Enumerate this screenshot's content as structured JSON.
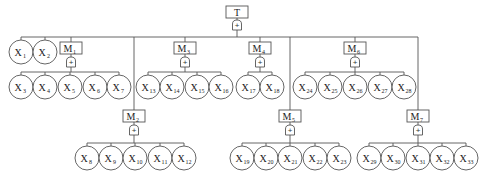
{
  "diagram": {
    "type": "fault-tree",
    "top_event": {
      "label": "T",
      "x": 237,
      "y": 6,
      "gate": "OR"
    },
    "bus_y": 37,
    "gate_symbol": "+",
    "intermediate_events": [
      {
        "id": "M1",
        "label": "M",
        "sub": "1",
        "x": 71,
        "y": 42,
        "children": [
          "X3",
          "X4",
          "X5",
          "X6",
          "X7"
        ],
        "child_y": 87,
        "child_xs": [
          21,
          45,
          70,
          95,
          119
        ]
      },
      {
        "id": "M2",
        "label": "M",
        "sub": "2",
        "x": 134,
        "y": 110,
        "children": [
          "X8",
          "X9",
          "X10",
          "X11",
          "X12"
        ],
        "child_y": 158,
        "child_xs": [
          87,
          111,
          135,
          160,
          184
        ]
      },
      {
        "id": "M3",
        "label": "M",
        "sub": "3",
        "x": 185,
        "y": 42,
        "children": [
          "X13",
          "X14",
          "X15",
          "X16"
        ],
        "child_y": 87,
        "child_xs": [
          148,
          172,
          197,
          221
        ]
      },
      {
        "id": "M4",
        "label": "M",
        "sub": "4",
        "x": 260,
        "y": 42,
        "children": [
          "X17",
          "X18"
        ],
        "child_y": 87,
        "child_xs": [
          248,
          272
        ]
      },
      {
        "id": "M5",
        "label": "M",
        "sub": "5",
        "x": 290,
        "y": 110,
        "children": [
          "X19",
          "X20",
          "X21",
          "X22",
          "X23"
        ],
        "child_y": 158,
        "child_xs": [
          242,
          266,
          290,
          315,
          339
        ]
      },
      {
        "id": "M6",
        "label": "M",
        "sub": "6",
        "x": 355,
        "y": 42,
        "children": [
          "X24",
          "X25",
          "X26",
          "X27",
          "X28"
        ],
        "child_y": 87,
        "child_xs": [
          305,
          330,
          355,
          380,
          404
        ]
      },
      {
        "id": "M7",
        "label": "M",
        "sub": "7",
        "x": 418,
        "y": 110,
        "children": [
          "X29",
          "X30",
          "X31",
          "X32",
          "X33"
        ],
        "child_y": 158,
        "child_xs": [
          369,
          393,
          418,
          442,
          466
        ]
      }
    ],
    "top_children_order": [
      "X1",
      "X2",
      "M1",
      "M2",
      "M3",
      "M4",
      "M5",
      "M6",
      "M7"
    ],
    "basic_events_top": [
      {
        "id": "X1",
        "label": "X",
        "sub": "1",
        "x": 21,
        "y": 52
      },
      {
        "id": "X2",
        "label": "X",
        "sub": "2",
        "x": 45,
        "y": 52
      }
    ],
    "bus_x_range": [
      21,
      418
    ]
  }
}
